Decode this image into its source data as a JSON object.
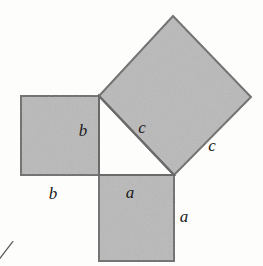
{
  "figure": {
    "name": "pythagorean-theorem-squares-diagram",
    "background_color": "#fdfdfb",
    "square_fill_color": "#b9b9b9",
    "square_stroke_color": "#6a6a6a",
    "stroke_width": 2,
    "texture": "speckled halftone scan noise"
  },
  "triangle": {
    "name": "right-triangle",
    "vertices": {
      "top_left": [
        99,
        96
      ],
      "bottom_left": [
        99,
        175
      ],
      "bottom_right": [
        174,
        175
      ]
    },
    "right_angle_at": "bottom_left",
    "legs": [
      "a",
      "b"
    ],
    "hypotenuse": "c",
    "fill": "none"
  },
  "squares": [
    {
      "id": "square-a",
      "side_label": "a",
      "orientation": "axis-aligned",
      "position": "below-triangle",
      "points": "99,175 174,175 174,261 99,261"
    },
    {
      "id": "square-b",
      "side_label": "b",
      "orientation": "axis-aligned",
      "position": "left-of-triangle",
      "points": "21,96 99,96 99,175 21,175"
    },
    {
      "id": "square-c",
      "side_label": "c",
      "orientation": "tilted",
      "position": "on-hypotenuse",
      "points": "99,96 173,16 251,97 174,175"
    }
  ],
  "labels": [
    {
      "id": "label-b-inner",
      "text": "b",
      "x": 83,
      "y": 136,
      "side": "b",
      "placement": "inside-triangle-left-leg"
    },
    {
      "id": "label-b-outer",
      "text": "b",
      "x": 53,
      "y": 199,
      "side": "b",
      "placement": "below-square-b"
    },
    {
      "id": "label-c-inner",
      "text": "c",
      "x": 142,
      "y": 133,
      "side": "c",
      "placement": "inside-square-c"
    },
    {
      "id": "label-c-outer",
      "text": "c",
      "x": 212,
      "y": 151,
      "side": "c",
      "placement": "outside-square-c-right"
    },
    {
      "id": "label-a-inner",
      "text": "a",
      "x": 130,
      "y": 198,
      "side": "a",
      "placement": "inside-square-a-top"
    },
    {
      "id": "label-a-outer",
      "text": "a",
      "x": 184,
      "y": 222,
      "side": "a",
      "placement": "right-of-square-a"
    }
  ],
  "margin_mark": {
    "id": "cropped-margin-glyph",
    "text": "╱",
    "x": 0,
    "y": 252,
    "note": "partial character clipped at left page edge"
  }
}
